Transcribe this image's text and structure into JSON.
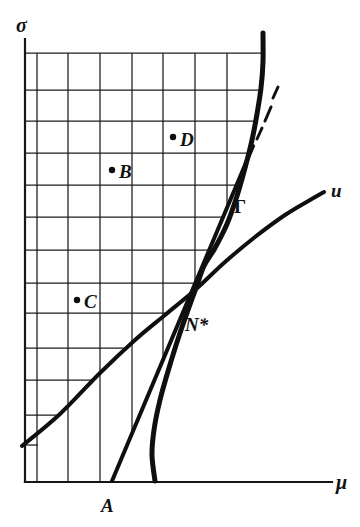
{
  "figure": {
    "background": "#ffffff",
    "ink": "#111111",
    "axes": {
      "y_label": "σ",
      "x_label": "μ",
      "y_axis": {
        "x": 25,
        "y1": 39,
        "y2": 482
      },
      "x_axis": {
        "y": 482,
        "x1": 25,
        "x2": 332
      }
    },
    "grid": {
      "vertical_lines": [
        {
          "x": 37,
          "y1": 53,
          "y2": 482
        },
        {
          "x": 68,
          "y1": 53,
          "y2": 482
        },
        {
          "x": 100,
          "y1": 53,
          "y2": 482
        },
        {
          "x": 132,
          "y1": 53,
          "y2": 433
        },
        {
          "x": 163,
          "y1": 53,
          "y2": 360
        },
        {
          "x": 195,
          "y1": 53,
          "y2": 284
        },
        {
          "x": 227,
          "y1": 53,
          "y2": 208
        }
      ],
      "horizontal_lines": [
        {
          "y": 53,
          "x1": 25,
          "x2": 262
        },
        {
          "y": 90,
          "x1": 25,
          "x2": 260
        },
        {
          "y": 121,
          "x1": 25,
          "x2": 255
        },
        {
          "y": 153,
          "x1": 25,
          "x2": 249
        },
        {
          "y": 185,
          "x1": 25,
          "x2": 236
        },
        {
          "y": 217,
          "x1": 25,
          "x2": 223
        },
        {
          "y": 250,
          "x1": 25,
          "x2": 209
        },
        {
          "y": 283,
          "x1": 25,
          "x2": 195
        },
        {
          "y": 313,
          "x1": 25,
          "x2": 167
        },
        {
          "y": 348,
          "x1": 25,
          "x2": 126
        },
        {
          "y": 380,
          "x1": 25,
          "x2": 92
        },
        {
          "y": 415,
          "x1": 25,
          "x2": 59
        },
        {
          "y": 445,
          "x1": 25,
          "x2": 38
        }
      ]
    },
    "curves": {
      "gamma": {
        "label": "Γ",
        "points": [
          [
            263,
            33
          ],
          [
            263,
            62
          ],
          [
            261,
            88
          ],
          [
            257,
            114
          ],
          [
            252,
            140
          ],
          [
            245,
            168
          ],
          [
            237,
            196
          ],
          [
            227,
            224
          ],
          [
            215,
            248
          ],
          [
            204,
            266
          ],
          [
            196,
            288
          ],
          [
            188,
            310
          ],
          [
            179,
            336
          ],
          [
            169,
            368
          ],
          [
            160,
            400
          ],
          [
            154,
            430
          ],
          [
            152,
            455
          ],
          [
            155,
            481
          ]
        ]
      },
      "u": {
        "label": "u",
        "points": [
          [
            22,
            446
          ],
          [
            60,
            414
          ],
          [
            100,
            373
          ],
          [
            135,
            340
          ],
          [
            165,
            315
          ],
          [
            195,
            290
          ],
          [
            225,
            262
          ],
          [
            255,
            237
          ],
          [
            285,
            215
          ],
          [
            310,
            200
          ],
          [
            324,
            192
          ]
        ]
      },
      "tangent_line": {
        "from_point": "A",
        "solid": [
          112,
          481,
          253,
          146
        ],
        "dashes": [
          [
            257,
            139,
            262,
            128
          ],
          [
            265,
            121,
            271,
            107
          ],
          [
            273,
            98,
            278,
            87
          ]
        ]
      }
    },
    "marked_points": [
      {
        "label": "D",
        "dot": [
          173,
          137
        ],
        "dot_radius": 3.2
      },
      {
        "label": "B",
        "dot": [
          112,
          170
        ],
        "dot_radius": 3.2
      },
      {
        "label": "C",
        "dot": [
          77,
          300
        ],
        "dot_radius": 3.2
      }
    ],
    "text_labels": {
      "sigma": {
        "text": "σ",
        "x": 16,
        "y": 32
      },
      "mu": {
        "text": "μ",
        "x": 336,
        "y": 489
      },
      "A": {
        "text": "A",
        "x": 101,
        "y": 512
      },
      "B": {
        "text": "B",
        "x": 119,
        "y": 178
      },
      "C": {
        "text": "C",
        "x": 84,
        "y": 308
      },
      "D": {
        "text": "D",
        "x": 180,
        "y": 146
      },
      "gamma": {
        "text": "Γ",
        "x": 234,
        "y": 213
      },
      "n_star": {
        "text": "N*",
        "x": 185,
        "y": 331
      },
      "u": {
        "text": "u",
        "x": 331,
        "y": 197
      }
    }
  }
}
